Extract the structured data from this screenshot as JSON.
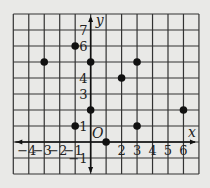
{
  "chart_data": {
    "type": "scatter",
    "title": "",
    "xlabel": "x",
    "ylabel": "y",
    "origin_label": "O",
    "xlim": [
      -5,
      7
    ],
    "ylim": [
      -2,
      8
    ],
    "grid": true,
    "x_ticks": [
      -4,
      -3,
      -2,
      -1,
      2,
      3,
      4,
      5,
      6
    ],
    "y_ticks": [
      -1,
      1,
      3,
      4,
      6,
      7
    ],
    "points": [
      {
        "x": -3,
        "y": 5
      },
      {
        "x": -1,
        "y": 6
      },
      {
        "x": 0,
        "y": 5
      },
      {
        "x": 2,
        "y": 4
      },
      {
        "x": 3,
        "y": 5
      },
      {
        "x": 0,
        "y": 2
      },
      {
        "x": 6,
        "y": 2
      },
      {
        "x": -1,
        "y": 1
      },
      {
        "x": 3,
        "y": 1
      },
      {
        "x": 1,
        "y": 0
      }
    ]
  },
  "colors": {
    "background": "#e9e9e7",
    "grid": "#333333",
    "points": "#111111"
  }
}
